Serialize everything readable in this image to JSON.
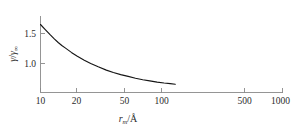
{
  "chart_data": {
    "type": "line",
    "title": "",
    "subtitle": "",
    "xlabel": "r_m/Å",
    "xlabel_parts": {
      "symbol": "r",
      "subscript": "m",
      "separator": "/",
      "unit": "Å"
    },
    "ylabel": "γ/γ∞",
    "ylabel_parts": {
      "numerator": "γ",
      "separator": "/",
      "denominator": "γ",
      "denominator_subscript": "∞"
    },
    "xscale": "log",
    "yscale": "linear",
    "xlim": [
      10,
      1000
    ],
    "ylim": [
      0.55,
      1.78
    ],
    "grid": false,
    "legend": null,
    "xticks": [
      10,
      20,
      50,
      100,
      500,
      1000
    ],
    "xtick_labels": [
      "10",
      "20",
      "50",
      "100",
      "500",
      "1000"
    ],
    "yticks": [
      1.0,
      1.5
    ],
    "ytick_labels": [
      "1.0",
      "1.5"
    ],
    "series": [
      {
        "name": "surface tension ratio",
        "color": "#151515",
        "x": [
          10,
          11,
          12,
          13,
          14,
          15,
          16,
          18,
          20,
          23,
          26,
          30,
          35,
          40,
          46,
          53,
          61,
          70,
          80,
          92,
          105,
          118,
          130
        ],
        "y": [
          1.65,
          1.56,
          1.48,
          1.41,
          1.35,
          1.3,
          1.26,
          1.185,
          1.125,
          1.055,
          1.0,
          0.945,
          0.89,
          0.85,
          0.815,
          0.785,
          0.755,
          0.73,
          0.71,
          0.69,
          0.675,
          0.665,
          0.655
        ]
      }
    ]
  },
  "axes": {
    "x_axis_name": "x-axis",
    "y_axis_name": "y-axis"
  }
}
